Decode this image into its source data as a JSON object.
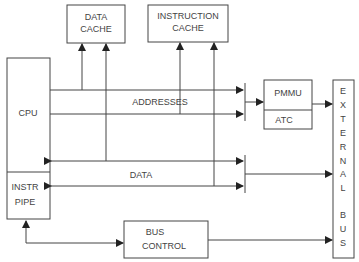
{
  "diagram": {
    "type": "block-diagram",
    "blocks": {
      "data_cache": {
        "line1": "DATA",
        "line2": "CACHE"
      },
      "instruction_cache": {
        "line1": "INSTRUCTION",
        "line2": "CACHE"
      },
      "cpu": {
        "label": "CPU"
      },
      "instr_pipe": {
        "line1": "INSTR",
        "line2": "PIPE"
      },
      "pmmu": {
        "label": "PMMU"
      },
      "atc": {
        "label": "ATC"
      },
      "external_bus": {
        "letters": [
          "E",
          "X",
          "T",
          "E",
          "R",
          "N",
          "A",
          "L",
          "",
          "B",
          "U",
          "S"
        ]
      },
      "bus_control": {
        "line1": "BUS",
        "line2": "CONTROL"
      }
    },
    "buses": {
      "addresses": {
        "label": "ADDRESSES"
      },
      "data": {
        "label": "DATA"
      }
    },
    "colors": {
      "line": "#444444",
      "arrow": "#222222",
      "background": "#ffffff"
    }
  }
}
